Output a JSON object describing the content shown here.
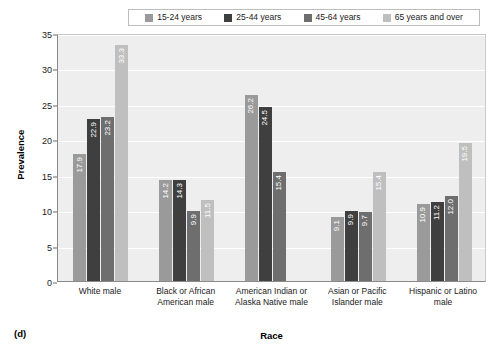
{
  "panel_label": "(d)",
  "legend": {
    "entries": [
      {
        "label": "15-24 years",
        "color": "#9a9a9a"
      },
      {
        "label": "25-44 years",
        "color": "#3f3f3f"
      },
      {
        "label": "45-64 years",
        "color": "#6e6e6e"
      },
      {
        "label": "65 years and over",
        "color": "#bfbfbf"
      }
    ]
  },
  "chart_data": {
    "type": "bar",
    "title": "",
    "xlabel": "Race",
    "ylabel": "Prevalence",
    "ylim": [
      0,
      35
    ],
    "yticks": [
      0,
      5,
      10,
      15,
      20,
      25,
      30,
      35
    ],
    "grid": true,
    "legend_position": "top",
    "categories": [
      "White male",
      "Black or African American male",
      "American Indian or Alaska Native male",
      "Asian or Pacific Islander male",
      "Hispanic or Latino male"
    ],
    "series": [
      {
        "name": "15-24 years",
        "color": "#9a9a9a",
        "values": [
          17.9,
          14.2,
          26.2,
          9.1,
          10.9
        ]
      },
      {
        "name": "25-44 years",
        "color": "#3f3f3f",
        "values": [
          22.9,
          14.3,
          24.5,
          9.9,
          11.2
        ]
      },
      {
        "name": "45-64 years",
        "color": "#6e6e6e",
        "values": [
          23.2,
          9.9,
          15.4,
          9.7,
          12.0
        ]
      },
      {
        "name": "65 years and over",
        "color": "#bfbfbf",
        "values": [
          33.3,
          11.5,
          null,
          15.4,
          19.5
        ]
      }
    ]
  }
}
